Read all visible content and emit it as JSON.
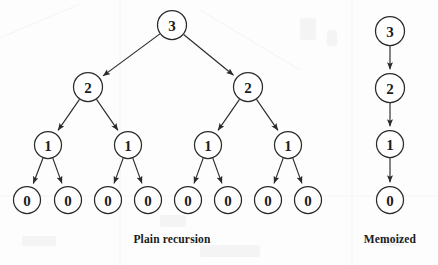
{
  "figure": {
    "background_color": "#fdfdfd",
    "stroke_color": "#2a2a2a",
    "text_color": "#1c1c1c",
    "node_radius": 14.5,
    "leaf_radius": 13.5
  },
  "panels": [
    {
      "id": "plain-recursion",
      "caption": "Plain recursion",
      "caption_x": 172,
      "caption_y": 243,
      "nodes": [
        {
          "id": "p-r",
          "label": "3",
          "x": 172,
          "y": 25,
          "r": 14.5
        },
        {
          "id": "p-l1",
          "label": "2",
          "x": 88,
          "y": 87,
          "r": 14.5
        },
        {
          "id": "p-r1",
          "label": "2",
          "x": 248,
          "y": 87,
          "r": 14.5
        },
        {
          "id": "p-l2a",
          "label": "1",
          "x": 48,
          "y": 145,
          "r": 13.5
        },
        {
          "id": "p-l2b",
          "label": "1",
          "x": 128,
          "y": 145,
          "r": 13.5
        },
        {
          "id": "p-r2a",
          "label": "1",
          "x": 208,
          "y": 145,
          "r": 13.5
        },
        {
          "id": "p-r2b",
          "label": "1",
          "x": 288,
          "y": 145,
          "r": 13.5
        },
        {
          "id": "p-z1",
          "label": "0",
          "x": 27,
          "y": 200,
          "r": 13.5
        },
        {
          "id": "p-z2",
          "label": "0",
          "x": 68,
          "y": 200,
          "r": 13.5
        },
        {
          "id": "p-z3",
          "label": "0",
          "x": 108,
          "y": 200,
          "r": 13.5
        },
        {
          "id": "p-z4",
          "label": "0",
          "x": 148,
          "y": 200,
          "r": 13.5
        },
        {
          "id": "p-z5",
          "label": "0",
          "x": 188,
          "y": 200,
          "r": 13.5
        },
        {
          "id": "p-z6",
          "label": "0",
          "x": 228,
          "y": 200,
          "r": 13.5
        },
        {
          "id": "p-z7",
          "label": "0",
          "x": 268,
          "y": 200,
          "r": 13.5
        },
        {
          "id": "p-z8",
          "label": "0",
          "x": 308,
          "y": 200,
          "r": 13.5
        }
      ],
      "edges": [
        {
          "from": "p-r",
          "to": "p-l1"
        },
        {
          "from": "p-r",
          "to": "p-r1"
        },
        {
          "from": "p-l1",
          "to": "p-l2a"
        },
        {
          "from": "p-l1",
          "to": "p-l2b"
        },
        {
          "from": "p-r1",
          "to": "p-r2a"
        },
        {
          "from": "p-r1",
          "to": "p-r2b"
        },
        {
          "from": "p-l2a",
          "to": "p-z1"
        },
        {
          "from": "p-l2a",
          "to": "p-z2"
        },
        {
          "from": "p-l2b",
          "to": "p-z3"
        },
        {
          "from": "p-l2b",
          "to": "p-z4"
        },
        {
          "from": "p-r2a",
          "to": "p-z5"
        },
        {
          "from": "p-r2a",
          "to": "p-z6"
        },
        {
          "from": "p-r2b",
          "to": "p-z7"
        },
        {
          "from": "p-r2b",
          "to": "p-z8"
        }
      ]
    },
    {
      "id": "memoized",
      "caption": "Memoized",
      "caption_x": 390,
      "caption_y": 243,
      "nodes": [
        {
          "id": "m-3",
          "label": "3",
          "x": 390,
          "y": 31,
          "r": 14.5
        },
        {
          "id": "m-2",
          "label": "2",
          "x": 390,
          "y": 88,
          "r": 14.5
        },
        {
          "id": "m-1",
          "label": "1",
          "x": 390,
          "y": 144,
          "r": 13.5
        },
        {
          "id": "m-0",
          "label": "0",
          "x": 390,
          "y": 200,
          "r": 13.5
        }
      ],
      "edges": [
        {
          "from": "m-3",
          "to": "m-2"
        },
        {
          "from": "m-2",
          "to": "m-1"
        },
        {
          "from": "m-1",
          "to": "m-0"
        }
      ]
    }
  ]
}
